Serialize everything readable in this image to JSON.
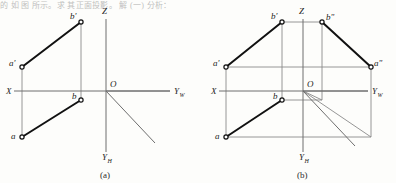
{
  "page": {
    "width": 396,
    "height": 183,
    "background": "#fdfdfb",
    "top_text": "的  如 图  所示。求  其正面投影。  解 (一) 分析：",
    "ink_color": "#111111",
    "axis_color": "#6e6e6e",
    "projection_line_color": "#8a8a8a"
  },
  "figures": [
    {
      "id": "figure-a",
      "caption": "(a)",
      "caption_x": 100,
      "caption_y": 170,
      "origin": {
        "x": 106,
        "y": 91,
        "label": "O",
        "label_x": 110,
        "label_y": 87
      },
      "axes": [
        {
          "name": "x-axis",
          "label": "X",
          "label_x": 6,
          "label_y": 94,
          "x1": 14,
          "y1": 91,
          "x2": 170,
          "y2": 91
        },
        {
          "name": "z-axis",
          "label": "Z",
          "label_x": 102,
          "label_y": 14,
          "x1": 106,
          "y1": 19,
          "x2": 106,
          "y2": 91
        },
        {
          "name": "yw-axis",
          "label": "Y",
          "sub": "W",
          "label_x": 174,
          "label_y": 94,
          "x1": 106,
          "y1": 91,
          "x2": 170,
          "y2": 91
        },
        {
          "name": "yh-axis",
          "label": "Y",
          "sub": "H",
          "label_x": 102,
          "label_y": 160,
          "x1": 106,
          "y1": 91,
          "x2": 106,
          "y2": 152
        },
        {
          "name": "y-oblique-axis",
          "label": "",
          "x1": 106,
          "y1": 91,
          "x2": 155,
          "y2": 143
        }
      ],
      "points": [
        {
          "name": "a-prime",
          "label": "a'",
          "x": 22,
          "y": 67,
          "label_x": 9,
          "label_y": 66
        },
        {
          "name": "b-prime",
          "label": "b'",
          "x": 81,
          "y": 22,
          "label_x": 70,
          "label_y": 19
        },
        {
          "name": "a",
          "label": "a",
          "x": 22,
          "y": 137,
          "label_x": 11,
          "label_y": 139
        },
        {
          "name": "b",
          "label": "b",
          "x": 81,
          "y": 100,
          "label_x": 72,
          "label_y": 99
        }
      ],
      "solid_segments": [
        {
          "name": "segment-a-prime-b-prime",
          "x1": 22,
          "y1": 67,
          "x2": 81,
          "y2": 22
        },
        {
          "name": "segment-a-b",
          "x1": 22,
          "y1": 137,
          "x2": 81,
          "y2": 100
        }
      ],
      "thin_lines": [
        {
          "name": "recall-line-a",
          "x1": 22,
          "y1": 67,
          "x2": 22,
          "y2": 137
        },
        {
          "name": "recall-line-b",
          "x1": 81,
          "y1": 22,
          "x2": 81,
          "y2": 100
        }
      ]
    },
    {
      "id": "figure-b",
      "caption": "(b)",
      "caption_x": 297,
      "caption_y": 170,
      "origin": {
        "x": 303,
        "y": 91,
        "label": "O",
        "label_x": 307,
        "label_y": 87
      },
      "axes": [
        {
          "name": "x-axis",
          "label": "X",
          "label_x": 211,
          "label_y": 94,
          "x1": 219,
          "y1": 91,
          "x2": 368,
          "y2": 91
        },
        {
          "name": "z-axis",
          "label": "Z",
          "label_x": 299,
          "label_y": 14,
          "x1": 303,
          "y1": 19,
          "x2": 303,
          "y2": 91
        },
        {
          "name": "yw-axis",
          "label": "Y",
          "sub": "W",
          "label_x": 372,
          "label_y": 94,
          "x1": 303,
          "y1": 91,
          "x2": 368,
          "y2": 91
        },
        {
          "name": "yh-axis",
          "label": "Y",
          "sub": "H",
          "label_x": 299,
          "label_y": 160,
          "x1": 303,
          "y1": 91,
          "x2": 303,
          "y2": 152
        },
        {
          "name": "y-oblique-axis",
          "label": "",
          "x1": 303,
          "y1": 91,
          "x2": 355,
          "y2": 146
        }
      ],
      "points": [
        {
          "name": "a-prime",
          "label": "a'",
          "x": 226,
          "y": 67,
          "label_x": 213,
          "label_y": 66
        },
        {
          "name": "b-prime",
          "label": "b'",
          "x": 282,
          "y": 22,
          "label_x": 271,
          "label_y": 19
        },
        {
          "name": "b-double-prime",
          "label": "bʺ",
          "x": 322,
          "y": 22,
          "label_x": 326,
          "label_y": 20
        },
        {
          "name": "a-double-prime",
          "label": "aʺ",
          "x": 371,
          "y": 67,
          "label_x": 374,
          "label_y": 66
        },
        {
          "name": "a",
          "label": "a",
          "x": 226,
          "y": 137,
          "label_x": 215,
          "label_y": 139
        },
        {
          "name": "b",
          "label": "b",
          "x": 282,
          "y": 100,
          "label_x": 273,
          "label_y": 99
        }
      ],
      "solid_segments": [
        {
          "name": "segment-a-prime-b-prime",
          "x1": 226,
          "y1": 67,
          "x2": 282,
          "y2": 22
        },
        {
          "name": "segment-b-double-prime-a-double-prime",
          "x1": 322,
          "y1": 22,
          "x2": 371,
          "y2": 67
        },
        {
          "name": "segment-a-b",
          "x1": 226,
          "y1": 137,
          "x2": 282,
          "y2": 100
        }
      ],
      "thin_lines": [
        {
          "name": "recall-line-a-left",
          "x1": 226,
          "y1": 67,
          "x2": 226,
          "y2": 137
        },
        {
          "name": "recall-line-b-left",
          "x1": 282,
          "y1": 22,
          "x2": 282,
          "y2": 100
        },
        {
          "name": "height-line-b-prime-b-double-prime",
          "x1": 282,
          "y1": 22,
          "x2": 322,
          "y2": 22
        },
        {
          "name": "height-line-a-prime-a-double-prime",
          "x1": 226,
          "y1": 67,
          "x2": 371,
          "y2": 67
        },
        {
          "name": "recall-line-b-double-prime",
          "x1": 322,
          "y1": 22,
          "x2": 322,
          "y2": 91
        },
        {
          "name": "recall-line-a-double-prime",
          "x1": 371,
          "y1": 67,
          "x2": 371,
          "y2": 137
        },
        {
          "name": "depth-line-a-bottom",
          "x1": 226,
          "y1": 137,
          "x2": 371,
          "y2": 137
        },
        {
          "name": "depth-line-b-horizontal",
          "x1": 282,
          "y1": 100,
          "x2": 322,
          "y2": 100
        },
        {
          "name": "depth-riser-b",
          "x1": 322,
          "y1": 91,
          "x2": 322,
          "y2": 100
        },
        {
          "name": "miter-line-b",
          "x1": 303,
          "y1": 91,
          "x2": 322,
          "y2": 100
        },
        {
          "name": "miter-line-a",
          "x1": 303,
          "y1": 91,
          "x2": 371,
          "y2": 137
        }
      ]
    }
  ]
}
